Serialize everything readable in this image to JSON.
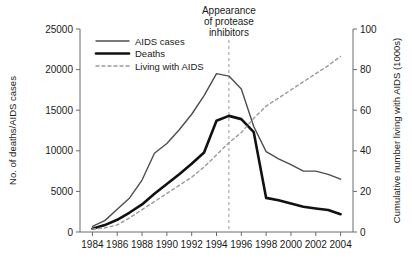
{
  "chart_data": {
    "type": "line",
    "title": "",
    "xlabel": "",
    "ylabel": "No. of deaths/AIDS cases",
    "y2label": "Cumulative number living with AIDS (1000s)",
    "grid": false,
    "legend_position": "top-left",
    "xlim": [
      1983,
      2005
    ],
    "ylim": [
      0,
      25000
    ],
    "y2lim": [
      0,
      100
    ],
    "x_ticks": [
      1984,
      1986,
      1988,
      1990,
      1992,
      1994,
      1996,
      1998,
      2000,
      2002,
      2004
    ],
    "x_tick_labels": [
      "1984",
      "1986",
      "1988",
      "1990",
      "1992",
      "1994",
      "1996",
      "1998",
      "2000",
      "2002",
      "2004"
    ],
    "y_ticks": [
      0,
      5000,
      10000,
      15000,
      20000,
      25000
    ],
    "y_tick_labels": [
      "0",
      "5000",
      "10000",
      "15000",
      "20000",
      "25000"
    ],
    "y2_ticks": [
      0,
      20,
      40,
      60,
      80,
      100
    ],
    "y2_tick_labels": [
      "0",
      "20",
      "40",
      "60",
      "80",
      "100"
    ],
    "x": [
      1984,
      1985,
      1986,
      1987,
      1988,
      1989,
      1990,
      1991,
      1992,
      1993,
      1994,
      1995,
      1996,
      1997,
      1998,
      1999,
      2000,
      2001,
      2002,
      2003,
      2004
    ],
    "series": [
      {
        "name": "AIDS cases",
        "axis": "left",
        "color": "#4d4d4d",
        "width": 1.4,
        "dash": "none",
        "values": [
          700,
          1400,
          2800,
          4200,
          6400,
          9700,
          10900,
          12600,
          14500,
          16800,
          19500,
          19200,
          17600,
          13000,
          9900,
          9000,
          8300,
          7500,
          7500,
          7100,
          6500
        ]
      },
      {
        "name": "Deaths",
        "axis": "left",
        "color": "#111111",
        "width": 2.6,
        "dash": "none",
        "values": [
          400,
          850,
          1500,
          2400,
          3400,
          4700,
          5900,
          7100,
          8400,
          9800,
          13700,
          14300,
          13900,
          12300,
          4200,
          3900,
          3500,
          3100,
          2900,
          2700,
          2200
        ]
      },
      {
        "name": "Living with AIDS",
        "axis": "right",
        "color": "#9a9a9a",
        "width": 1.4,
        "dash": "3 3",
        "values": [
          1.5,
          2.0,
          3.5,
          7.0,
          11.0,
          15.0,
          19.0,
          23.0,
          27.0,
          32.0,
          38.0,
          44.0,
          49.0,
          56.0,
          62.0,
          66.0,
          70.0,
          74.0,
          78.0,
          82.0,
          86.5
        ]
      }
    ],
    "annotations": [
      {
        "name": "protease-inhibitors-marker",
        "lines": [
          "Appearance",
          "of protease",
          "inhibitors"
        ],
        "x_value": 1995,
        "line_color": "#9a9a9a",
        "line_dash": "3 3"
      }
    ]
  },
  "legend": {
    "items": [
      {
        "label": "AIDS cases"
      },
      {
        "label": "Deaths"
      },
      {
        "label": "Living with AIDS"
      }
    ]
  }
}
